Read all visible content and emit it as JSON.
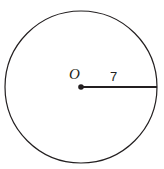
{
  "figure": {
    "type": "geometry-diagram",
    "background_color": "#ffffff",
    "stroke_color": "#231f20",
    "labels": {
      "center_point": "O",
      "radius_measure": "7"
    },
    "geometry": {
      "circle": {
        "center_x": 81,
        "center_y": 87,
        "radius_px": 76,
        "stroke_width": 1.2,
        "fill": "none"
      },
      "center_dot": {
        "cx": 81,
        "cy": 87,
        "r": 2.8,
        "fill": "#231f20"
      },
      "radius_segment": {
        "x1": 81,
        "y1": 87,
        "x2": 157,
        "y2": 87,
        "stroke_width": 1.8
      }
    }
  }
}
